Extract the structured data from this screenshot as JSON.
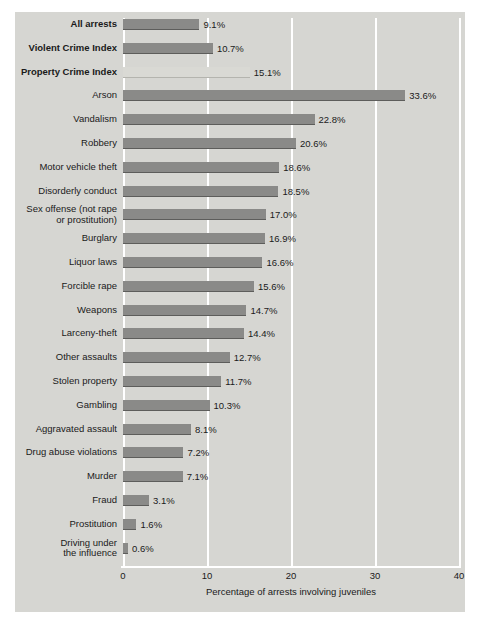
{
  "chart_data": {
    "type": "bar",
    "orientation": "horizontal",
    "title": "",
    "xlabel": "Percentage of arrests involving juveniles",
    "ylabel": "",
    "xlim": [
      0,
      40
    ],
    "xticks": [
      0,
      10,
      20,
      30,
      40
    ],
    "xtick_labels": [
      "0",
      "10",
      "20",
      "30",
      "40"
    ],
    "grid": true,
    "grid_axis": "x",
    "legend": false,
    "value_label_suffix": "%",
    "categories": [
      "All arrests",
      "Violent Crime Index",
      "Property Crime Index",
      "Arson",
      "Vandalism",
      "Robbery",
      "Motor vehicle theft",
      "Disorderly conduct",
      "Sex offense (not rape\nor prostitution)",
      "Burglary",
      "Liquor laws",
      "Forcible rape",
      "Weapons",
      "Larceny-theft",
      "Other assaults",
      "Stolen property",
      "Gambling",
      "Aggravated assault",
      "Drug abuse violations",
      "Murder",
      "Fraud",
      "Prostitution",
      "Driving under\nthe influence"
    ],
    "values": [
      9.1,
      10.7,
      15.1,
      33.6,
      22.8,
      20.6,
      18.6,
      18.5,
      17.0,
      16.9,
      16.6,
      15.6,
      14.7,
      14.4,
      12.7,
      11.7,
      10.3,
      8.1,
      7.2,
      7.1,
      3.1,
      1.6,
      0.6
    ],
    "value_labels": [
      "9.1%",
      "10.7%",
      "15.1%",
      "33.6%",
      "22.8%",
      "20.6%",
      "18.6%",
      "18.5%",
      "17.0%",
      "16.9%",
      "16.6%",
      "15.6%",
      "14.7%",
      "14.4%",
      "12.7%",
      "11.7%",
      "10.3%",
      "8.1%",
      "7.2%",
      "7.1%",
      "3.1%",
      "1.6%",
      "0.6%"
    ],
    "emphasized_categories": [
      "All arrests",
      "Violent Crime Index",
      "Property Crime Index"
    ],
    "highlighted_index": 2,
    "colors": {
      "panel_background": "#d6d6d2",
      "figure_background": "#ffffff",
      "bar": "#8a8a88",
      "bar_highlight": "#d9d9d4",
      "gridline": "#ffffff",
      "text": "#1a1a1a"
    }
  }
}
